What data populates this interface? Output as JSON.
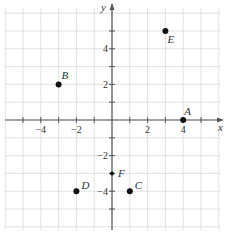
{
  "chart_data": {
    "type": "scatter",
    "title": "",
    "xlabel": "x",
    "ylabel": "y",
    "xlim": [
      -6,
      6
    ],
    "ylim": [
      -6,
      6
    ],
    "grid": true,
    "x_tick_labels": [
      "-4",
      "-2",
      "2",
      "4"
    ],
    "y_tick_labels": [
      "4",
      "2",
      "-2",
      "-4"
    ],
    "points": [
      {
        "label": "A",
        "x": 4,
        "y": 0
      },
      {
        "label": "B",
        "x": -3,
        "y": 2
      },
      {
        "label": "C",
        "x": 1,
        "y": -4
      },
      {
        "label": "D",
        "x": -2,
        "y": -4
      },
      {
        "label": "E",
        "x": 3,
        "y": 5
      },
      {
        "label": "F",
        "x": 0,
        "y": -3
      }
    ]
  },
  "colors": {
    "grid": "#d9d9d9",
    "axis": "#555555",
    "point": "#111111",
    "text": "#333333"
  }
}
